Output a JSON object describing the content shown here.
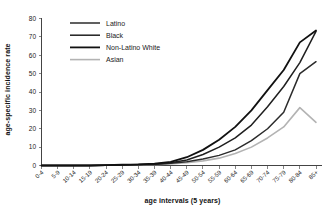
{
  "chart_data": {
    "type": "line",
    "title": "",
    "xlabel": "age intervals (5 years)",
    "ylabel": "age-specific incidence rate",
    "ylim": [
      0,
      80
    ],
    "yticks": [
      0,
      10,
      20,
      30,
      40,
      50,
      60,
      70,
      80
    ],
    "grid": false,
    "legend_position": "top-left",
    "categories": [
      "0-4",
      "5-9",
      "10-14",
      "15-19",
      "20-24",
      "25-29",
      "30-34",
      "35-39",
      "40-44",
      "45-49",
      "50-54",
      "55-59",
      "60-64",
      "65-69",
      "70-74",
      "75-79",
      "80-84",
      "85+"
    ],
    "series": [
      {
        "name": "Latino",
        "color": "#2b2b2b",
        "values": [
          0,
          0,
          0,
          0,
          0.2,
          0.3,
          0.4,
          0.6,
          1.2,
          2.0,
          3.5,
          5.5,
          8.5,
          13.5,
          20.0,
          29.0,
          50.0,
          56.5
        ]
      },
      {
        "name": "Black",
        "color": "#1f1f1f",
        "values": [
          0,
          0,
          0,
          0,
          0.2,
          0.3,
          0.5,
          0.8,
          1.5,
          3.0,
          6.0,
          10.0,
          15.0,
          22.0,
          32.0,
          43.0,
          56.0,
          73.0
        ]
      },
      {
        "name": "Non-Latino White",
        "color": "#111111",
        "values": [
          0,
          0,
          0,
          0,
          0.2,
          0.4,
          0.6,
          1.0,
          2.0,
          4.5,
          8.5,
          14.0,
          21.0,
          30.0,
          41.0,
          52.0,
          67.0,
          73.5
        ]
      },
      {
        "name": "Asian",
        "color": "#b3b3b3",
        "values": [
          0,
          0,
          0,
          0,
          0.1,
          0.2,
          0.3,
          0.4,
          0.8,
          1.5,
          2.5,
          4.0,
          6.5,
          10.0,
          15.0,
          21.0,
          31.5,
          23.5
        ]
      }
    ]
  },
  "legend": {
    "entries": [
      {
        "label": "Latino"
      },
      {
        "label": "Black"
      },
      {
        "label": "Non-Latino White"
      },
      {
        "label": "Asian"
      }
    ]
  },
  "axes": {
    "x_title": "age intervals (5 years)",
    "y_title": "age-specific incidence rate"
  }
}
